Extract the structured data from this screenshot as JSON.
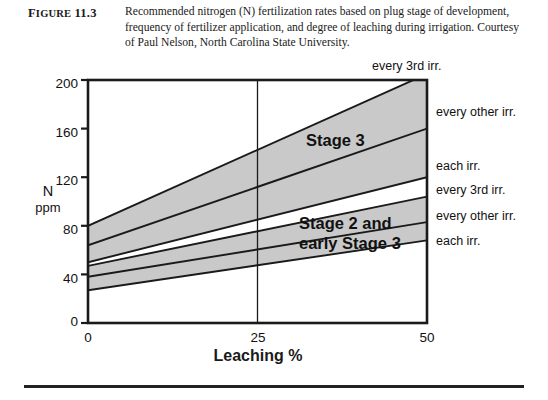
{
  "figure": {
    "label_prefix": "F",
    "label_rest": "IGURE",
    "label_number": "11.3",
    "caption": "Recommended nitrogen (N) fertilization rates based on plug stage of development, frequency of fertilizer application, and degree of leaching during irrigation. Courtesy of Paul Nelson, North Carolina State University."
  },
  "chart_data": {
    "type": "line",
    "title": "",
    "xlabel": "Leaching %",
    "ylabel": "N ppm",
    "ylabel_line1": "N",
    "ylabel_line2": "ppm",
    "xlim": [
      0,
      50
    ],
    "ylim": [
      0,
      200
    ],
    "xticks": [
      "0",
      "25",
      "50"
    ],
    "xtick_values": [
      0,
      25,
      50
    ],
    "yticks": [
      "0",
      "40",
      "80",
      "120",
      "160",
      "200"
    ],
    "ytick_values": [
      0,
      40,
      80,
      120,
      160,
      200
    ],
    "grid": false,
    "legend_position": "right-of-axes",
    "band_fill_color": "#c9c9c9",
    "line_color": "#1a1a1a",
    "axis_color": "#1a1a1a",
    "vertical_reference_line_x": 25,
    "annotations": [
      {
        "text": "Stage 3",
        "x": 33,
        "y": 142
      },
      {
        "text": "Stage 2 and",
        "x": 32,
        "y": 82
      },
      {
        "text": "early Stage 3",
        "x": 32,
        "y": 70
      }
    ],
    "series": [
      {
        "name": "every 3rd irr.",
        "group": "Stage 3",
        "x": [
          0,
          50
        ],
        "values": [
          80,
          205
        ],
        "right_label": "every 3rd irr."
      },
      {
        "name": "every other irr.",
        "group": "Stage 3",
        "x": [
          0,
          50
        ],
        "values": [
          64,
          160
        ],
        "right_label": "every other irr."
      },
      {
        "name": "each irr.",
        "group": "Stage 3",
        "x": [
          0,
          50
        ],
        "values": [
          50,
          120
        ],
        "right_label": "each irr."
      },
      {
        "name": "every 3rd irr.",
        "group": "Stage 2 and early Stage 3",
        "x": [
          0,
          50
        ],
        "values": [
          47,
          104
        ],
        "right_label": "every 3rd irr."
      },
      {
        "name": "every other irr.",
        "group": "Stage 2 and early Stage 3",
        "x": [
          0,
          50
        ],
        "values": [
          38,
          83
        ],
        "right_label": "every other irr."
      },
      {
        "name": "each irr.",
        "group": "Stage 2 and early Stage 3",
        "x": [
          0,
          50
        ],
        "values": [
          27,
          68
        ],
        "right_label": "each irr."
      }
    ],
    "bands": [
      {
        "name": "Stage 3",
        "lower_series": "each irr.",
        "upper_series": "every 3rd irr."
      },
      {
        "name": "Stage 2 and early Stage 3",
        "lower_series": "each irr.",
        "upper_series": "every 3rd irr."
      }
    ],
    "right_labels": [
      {
        "text": "every 3rd irr.",
        "at_y_px": 66
      },
      {
        "text": "every other irr.",
        "at_y_px": 112
      },
      {
        "text": "each irr.",
        "at_y_px": 166
      },
      {
        "text": "every 3rd irr.",
        "at_y_px": 190
      },
      {
        "text": "every other irr.",
        "at_y_px": 216
      },
      {
        "text": "each irr.",
        "at_y_px": 241
      }
    ]
  }
}
